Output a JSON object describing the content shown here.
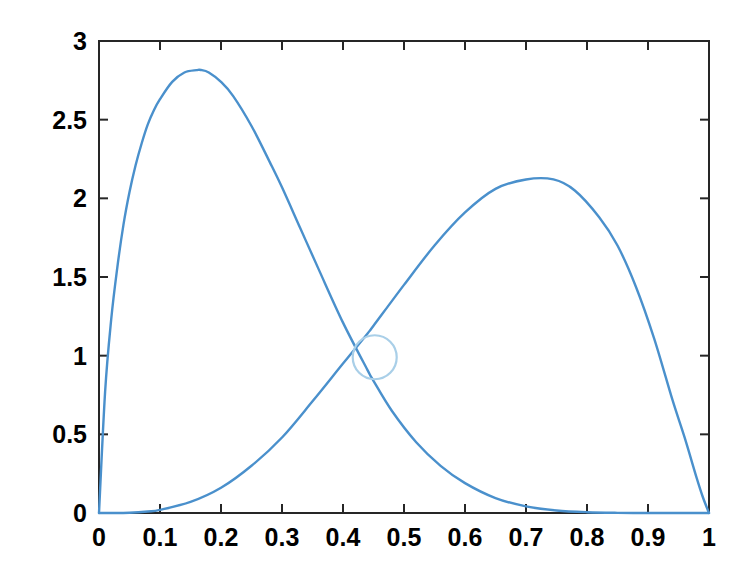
{
  "figure": {
    "background_color": "#ffffff",
    "axis_color": "#262626",
    "width": 751,
    "height": 577
  },
  "chart_data": {
    "type": "line",
    "title": "",
    "subtitle": "",
    "xlabel": "",
    "ylabel": "",
    "xlim": [
      0,
      1
    ],
    "ylim": [
      0,
      3
    ],
    "grid": false,
    "legend": null,
    "legend_position": "none",
    "x_ticks": [
      "0",
      "0.1",
      "0.2",
      "0.3",
      "0.4",
      "0.5",
      "0.6",
      "0.7",
      "0.8",
      "0.9",
      "1"
    ],
    "x_tick_values": [
      0,
      0.1,
      0.2,
      0.3,
      0.4,
      0.5,
      0.6,
      0.7,
      0.8,
      0.9,
      1
    ],
    "y_ticks": [
      "0",
      "0.5",
      "1",
      "1.5",
      "2",
      "2.5",
      "3"
    ],
    "y_tick_values": [
      0,
      0.5,
      1,
      1.5,
      2,
      2.5,
      3
    ],
    "line_color": "#4a90cc",
    "line_width": 2.4,
    "series": [
      {
        "name": "left-peaked-density",
        "color": "#4a90cc",
        "x": [
          0,
          0.01,
          0.02,
          0.03,
          0.04,
          0.05,
          0.06,
          0.07,
          0.08,
          0.09,
          0.1,
          0.12,
          0.14,
          0.16,
          0.167,
          0.18,
          0.2,
          0.22,
          0.25,
          0.28,
          0.3,
          0.33,
          0.36,
          0.4,
          0.44,
          0.45,
          0.48,
          0.52,
          0.56,
          0.6,
          0.65,
          0.7,
          0.75,
          0.8,
          0.85,
          0.9,
          0.95,
          0.98,
          1
        ],
        "y": [
          0,
          0.77,
          1.23,
          1.56,
          1.83,
          2.04,
          2.21,
          2.35,
          2.47,
          2.56,
          2.63,
          2.74,
          2.8,
          2.815,
          2.816,
          2.8,
          2.74,
          2.65,
          2.46,
          2.23,
          2.07,
          1.81,
          1.55,
          1.21,
          0.91,
          0.84,
          0.65,
          0.45,
          0.3,
          0.19,
          0.095,
          0.042,
          0.016,
          0.005,
          0.001,
          0.0001,
          0.0,
          0.0,
          0
        ]
      },
      {
        "name": "right-peaked-density",
        "color": "#4a90cc",
        "x": [
          0,
          0.02,
          0.05,
          0.08,
          0.1,
          0.15,
          0.2,
          0.25,
          0.3,
          0.35,
          0.4,
          0.44,
          0.45,
          0.5,
          0.55,
          0.6,
          0.65,
          0.7,
          0.745,
          0.78,
          0.82,
          0.85,
          0.88,
          0.91,
          0.94,
          0.96,
          0.98,
          0.99,
          1
        ],
        "y": [
          0,
          0.0,
          0.002,
          0.01,
          0.02,
          0.07,
          0.16,
          0.3,
          0.48,
          0.71,
          0.95,
          1.14,
          1.19,
          1.45,
          1.7,
          1.91,
          2.06,
          2.12,
          2.12,
          2.05,
          1.88,
          1.7,
          1.44,
          1.11,
          0.72,
          0.48,
          0.22,
          0.1,
          0
        ]
      }
    ],
    "markers": [
      {
        "name": "intersection-circle",
        "x": 0.452,
        "y": 0.99,
        "shape": "circle",
        "radius_px": 22,
        "filled": false,
        "color": "#a9cfe8",
        "line_width": 2.2
      }
    ]
  }
}
